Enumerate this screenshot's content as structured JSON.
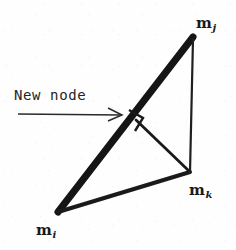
{
  "figure": {
    "background_color": "#fefefe",
    "ink_color": "#1a1a1a",
    "annotation": {
      "text": "New node",
      "arrow_icon": "right-arrow-icon"
    },
    "vertices": [
      {
        "id": "mj",
        "base": "m",
        "sub": "j",
        "x": 193,
        "y": 37,
        "label_x": 196,
        "label_y": 16
      },
      {
        "id": "mk",
        "base": "m",
        "sub": "k",
        "x": 190,
        "y": 172,
        "label_x": 189,
        "label_y": 183
      },
      {
        "id": "mi",
        "base": "m",
        "sub": "i",
        "x": 58,
        "y": 212,
        "label_x": 36,
        "label_y": 223
      }
    ],
    "new_node_point": {
      "x": 137,
      "y": 120
    },
    "edges": [
      {
        "name": "edge-mi-mj",
        "from": "mi",
        "to": "mj",
        "weight": "thick",
        "stroke_width": 7
      },
      {
        "name": "edge-mi-mk",
        "from": "mi",
        "to": "mk",
        "weight": "medium",
        "stroke_width": 4
      },
      {
        "name": "edge-mj-mk",
        "from": "mj",
        "to": "mk",
        "weight": "thin",
        "stroke_width": 2.2
      },
      {
        "name": "edge-newnode-mk",
        "from": "new_node_point",
        "to": "mk",
        "weight": "thin",
        "stroke_width": 2.6
      }
    ],
    "right_angle_marker": {
      "name": "right-angle-marker",
      "size": 15
    },
    "arrow": {
      "x1": 18,
      "y1": 114,
      "x2": 122,
      "y2": 115
    }
  }
}
